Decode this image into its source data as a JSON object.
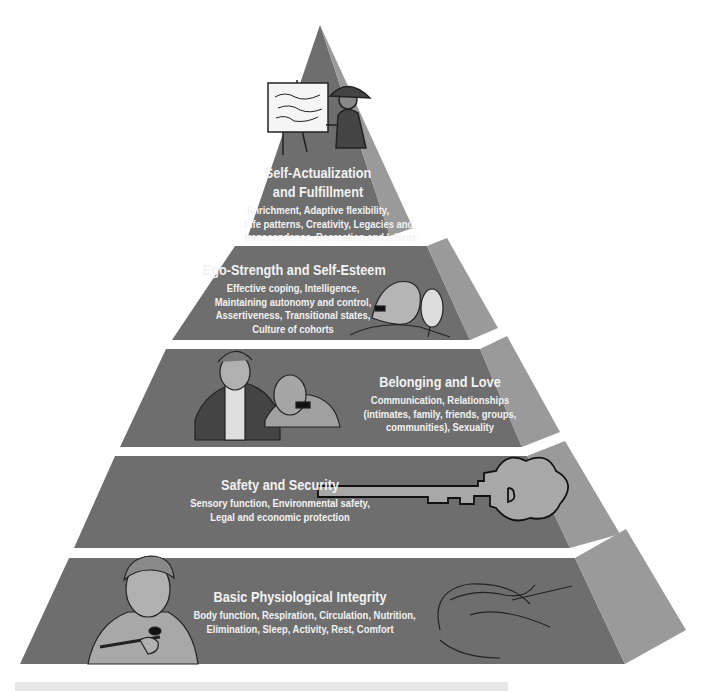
{
  "diagram": {
    "type": "pyramid",
    "colors": {
      "front_face": "#6e6e6e",
      "side_face": "#9a9a9a",
      "text": "#f2f2f2",
      "illustration_fill": "#a8a8a8",
      "illustration_stroke": "#222222",
      "background": "#ffffff",
      "bottom_band": "#e6e6e6"
    },
    "tiers": [
      {
        "level": 5,
        "title_lines": [
          "Self-Actualization",
          "and Fulfillment"
        ],
        "description_lines": [
          "Enrichment, Adaptive flexibility,",
          "Life patterns, Creativity, Legacies and",
          "transcendence, Recreation and leisure"
        ],
        "illustration": "painter-at-easel"
      },
      {
        "level": 4,
        "title_lines": [
          "Ego-Strength and Self-Esteem"
        ],
        "description_lines": [
          "Effective coping, Intelligence,",
          "Maintaining autonomy and control,",
          "Assertiveness, Transitional states,",
          "Culture of cohorts"
        ],
        "illustration": "woman-with-hand-mirror"
      },
      {
        "level": 3,
        "title_lines": [
          "Belonging and Love"
        ],
        "description_lines": [
          "Communication, Relationships",
          "(intimates, family, friends, groups,",
          "communities), Sexuality"
        ],
        "illustration": "two-people-talking"
      },
      {
        "level": 2,
        "title_lines": [
          "Safety and Security"
        ],
        "description_lines": [
          "Sensory function, Environmental safety,",
          "Legal and economic protection"
        ],
        "illustration": "key"
      },
      {
        "level": 1,
        "title_lines": [
          "Basic Physiological Integrity"
        ],
        "description_lines": [
          "Body function, Respiration, Circulation, Nutrition,",
          "Elimination, Sleep, Activity, Rest, Comfort"
        ],
        "illustration": "man-eating-and-sleeping-person"
      }
    ]
  }
}
